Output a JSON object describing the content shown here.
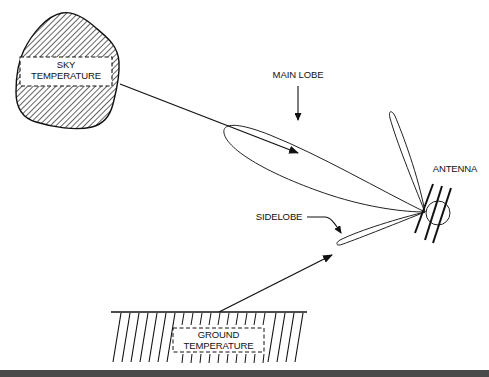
{
  "diagram": {
    "type": "antenna-noise-temperature",
    "labels": {
      "sky": [
        "SKY",
        "TEMPERATURE"
      ],
      "ground": [
        "GROUND",
        "TEMPERATURE"
      ],
      "main_lobe": "MAIN LOBE",
      "sidelobe": "SIDELOBE",
      "antenna": "ANTENNA"
    },
    "nodes": [
      {
        "id": "sky",
        "label": "SKY TEMPERATURE",
        "shape": "hatched-blob"
      },
      {
        "id": "main-lobe",
        "label": "MAIN LOBE",
        "shape": "elongated-lobe"
      },
      {
        "id": "back-lobe",
        "label": "",
        "shape": "narrow-lobe"
      },
      {
        "id": "sidelobe",
        "label": "SIDELOBE",
        "shape": "narrow-lobe"
      },
      {
        "id": "antenna",
        "label": "ANTENNA",
        "shape": "antenna-symbol"
      },
      {
        "id": "ground",
        "label": "GROUND TEMPERATURE",
        "shape": "hatched-ground"
      }
    ],
    "edges": [
      {
        "from": "sky",
        "to": "main-lobe"
      },
      {
        "from": "ground",
        "to": "sidelobe"
      }
    ],
    "colors": {
      "stroke": "#1a1a1a",
      "background": "#ffffff",
      "footer_bar": "#4a4a4a"
    }
  }
}
